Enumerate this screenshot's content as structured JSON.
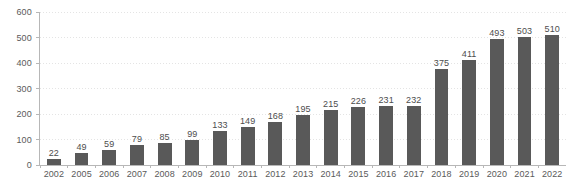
{
  "chart_data": {
    "type": "bar",
    "title": "",
    "subtitle": "",
    "xlabel": "",
    "ylabel": "",
    "categories": [
      "2002",
      "2005",
      "2006",
      "2007",
      "2008",
      "2009",
      "2010",
      "2011",
      "2012",
      "2013",
      "2014",
      "2015",
      "2016",
      "2017",
      "2018",
      "2019",
      "2020",
      "2021",
      "2022"
    ],
    "values": [
      22,
      49,
      59,
      79,
      85,
      99,
      133,
      149,
      168,
      195,
      215,
      226,
      231,
      232,
      375,
      411,
      493,
      503,
      510
    ],
    "data_labels": [
      "22",
      "49",
      "59",
      "79",
      "85",
      "99",
      "133",
      "149",
      "168",
      "195",
      "215",
      "226",
      "231",
      "232",
      "375",
      "411",
      "493",
      "503",
      "510"
    ],
    "ylim": [
      0,
      600
    ],
    "ytick_values": [
      600,
      500,
      400,
      300,
      200,
      100,
      0
    ],
    "ytick_labels": [
      "600",
      "500",
      "400",
      "300",
      "200",
      "100",
      "0"
    ],
    "grid": true,
    "grid_axis": "y",
    "legend": false,
    "legend_position": "none",
    "bar_color": "#595959",
    "grid_color": "#e4e4e4",
    "axis_color": "#b7b7b7",
    "label_color": "#4d4d4d",
    "tick_color": "#5a5a5a",
    "background_color": "#ffffff"
  }
}
